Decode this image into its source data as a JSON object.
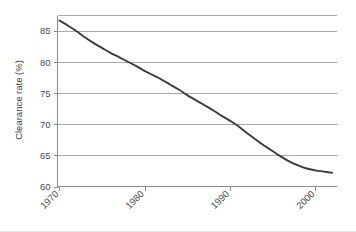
{
  "chart_data": {
    "type": "line",
    "title": "",
    "subtitle": "",
    "xlabel": "",
    "ylabel": "Clearance rate (%)",
    "xlim": [
      1969.8,
      2002.5
    ],
    "ylim": [
      60,
      87.5
    ],
    "grid": true,
    "legend": null,
    "x_ticks": [
      1970,
      1980,
      1990,
      2000
    ],
    "x_tick_labels": [
      "1970",
      "1980",
      "1990",
      "2000"
    ],
    "x_tick_rotation": -45,
    "y_ticks": [
      60,
      65,
      70,
      75,
      80,
      85
    ],
    "y_tick_labels": [
      "60",
      "65",
      "70",
      "75",
      "80",
      "85"
    ],
    "series": [
      {
        "name": "Clearance rate",
        "color": "#3b3b3b",
        "x": [
          1970,
          1971,
          1972,
          1973,
          1974,
          1975,
          1976,
          1977,
          1978,
          1979,
          1980,
          1981,
          1982,
          1983,
          1984,
          1985,
          1986,
          1987,
          1988,
          1989,
          1990,
          1991,
          1992,
          1993,
          1994,
          1995,
          1996,
          1997,
          1998,
          1999,
          2000,
          2001,
          2002
        ],
        "values": [
          86.7,
          85.9,
          85.0,
          84.0,
          83.1,
          82.3,
          81.5,
          80.8,
          80.1,
          79.4,
          78.6,
          77.9,
          77.2,
          76.4,
          75.6,
          74.7,
          73.9,
          73.1,
          72.3,
          71.4,
          70.6,
          69.7,
          68.6,
          67.6,
          66.6,
          65.7,
          64.8,
          64.0,
          63.4,
          62.9,
          62.6,
          62.4,
          62.2
        ]
      }
    ],
    "colors": {
      "line": "#3b3b3b",
      "gridline": "#a8a8a8",
      "axis": "#8c8c8c",
      "text": "#4a4a4a",
      "background": "#ffffff"
    }
  },
  "axes": {
    "y_title": "Clearance rate (%)"
  }
}
